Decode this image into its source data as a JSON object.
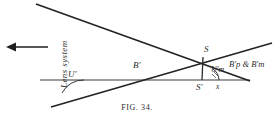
{
  "figure": {
    "caption": "FIG. 34.",
    "type": "optical-ray-diagram",
    "background": "#ffffff",
    "ink_color": "#2b2b2b"
  },
  "labels": {
    "lens_system": "Lens system",
    "angle_u_prime": "U′",
    "point_b_prime": "B′",
    "point_s": "S",
    "point_s_prime": "S′",
    "angle_u_prime_m": "U′m",
    "distance_x": "x",
    "b_prime_p_and_b_prime_m": "B′p & B′m"
  },
  "geometry": {
    "axis": {
      "x1": 40,
      "y1": 80,
      "x2": 249,
      "y2": 80
    },
    "ray_upper_left_to_lower_right": {
      "x1": 36,
      "y1": 4,
      "x2": 249,
      "y2": 80
    },
    "ray_lower_left_to_upper_right": {
      "x1": 52,
      "y1": 106,
      "x2": 271,
      "y2": 44
    },
    "vertical_s_to_s_prime": {
      "x1": 203,
      "y1": 57,
      "x2": 202,
      "y2": 80
    },
    "arrow": {
      "x1": 48,
      "y1": 47,
      "x2": 8,
      "y2": 47,
      "direction": "left"
    },
    "angle_arc_u_prime": {
      "cx": 60,
      "cy": 80,
      "r": 22
    },
    "angle_arc_u_prime_m": {
      "cx": 231,
      "cy": 80,
      "r": 16
    }
  }
}
